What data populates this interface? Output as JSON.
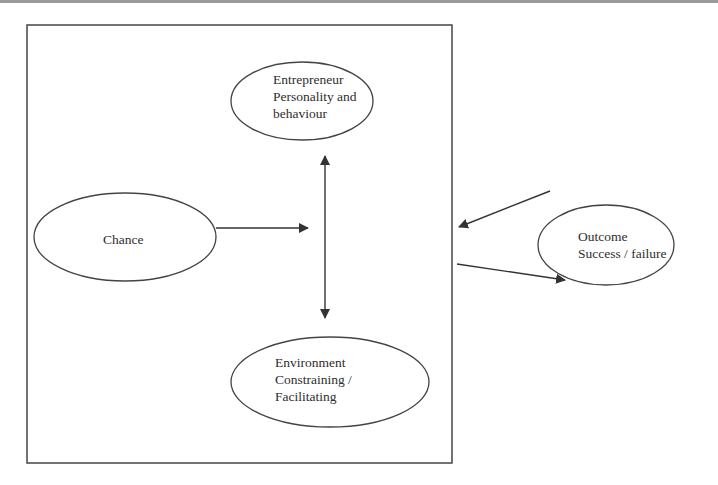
{
  "diagram": {
    "nodes": {
      "entrepreneur": {
        "lines": [
          "Entrepreneur",
          "Personality and",
          "behaviour"
        ]
      },
      "chance": {
        "lines": [
          "Chance"
        ]
      },
      "environment": {
        "lines": [
          "Environment",
          "Constraining /",
          "Facilitating"
        ]
      },
      "outcome": {
        "lines": [
          "Outcome",
          "Success / failure"
        ]
      }
    },
    "edges": [
      {
        "from": "chance",
        "to": "system-box",
        "type": "arrow"
      },
      {
        "from": "entrepreneur",
        "to": "environment",
        "type": "double-arrow"
      },
      {
        "from": "outcome",
        "to": "system-box",
        "type": "arrow"
      },
      {
        "from": "system-box",
        "to": "outcome",
        "type": "arrow"
      }
    ],
    "colors": {
      "stroke": "#333333",
      "background": "#ffffff"
    }
  }
}
